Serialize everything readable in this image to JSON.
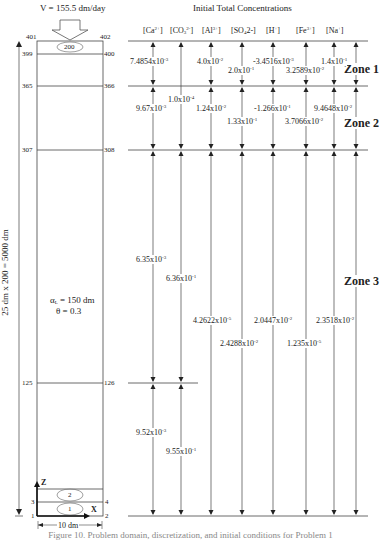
{
  "velocity_label": "V = 155.5 dm/day",
  "title": "Initial Total Concentrations",
  "species": [
    "[Ca2+]",
    "[CO32-]",
    "[Al3+]",
    "[SO42-]",
    "[H+]",
    "[Fe3+]",
    "[Na+]"
  ],
  "species_display": {
    "ca": {
      "base": "[Ca",
      "sup": "2+",
      "end": "]"
    },
    "co3": {
      "base": "[CO",
      "sub": "3",
      "sup": "2-",
      "end": "]"
    },
    "al": {
      "base": "[Al",
      "sup": "3+",
      "end": "]"
    },
    "so4": {
      "base": "[SO",
      "sub": "4",
      "after": "2-]"
    },
    "h": {
      "base": "[H",
      "sup": "+",
      "end": "]"
    },
    "fe": {
      "base": "[Fe",
      "sup": "3+",
      "end": "]"
    },
    "na": {
      "base": "[Na",
      "sup": "+",
      "end": "]"
    }
  },
  "zones": {
    "zone1": "Zone 1",
    "zone2": "Zone 2",
    "zone3": "Zone 3"
  },
  "nodes": {
    "n401": "401",
    "n402": "402",
    "n399": "399",
    "n400": "400",
    "n365": "365",
    "n366": "366",
    "n307": "307",
    "n308": "308",
    "n125": "125",
    "n126": "126",
    "n3": "3",
    "n4": "4",
    "n1": "1",
    "n2": "2"
  },
  "elements": {
    "top": "200",
    "e2": "2",
    "e1": "1"
  },
  "column_params": {
    "alpha": "α",
    "alpha_sub": "L",
    "alpha_rest": " = 150 dm",
    "theta": "θ = 0.3"
  },
  "height_label": "25 dm x 200 = 5000 dm",
  "width_label": "10 dm",
  "axes": {
    "z": "Z",
    "x": "X"
  },
  "values": {
    "zone1": {
      "ca": {
        "m": "7.4854x10",
        "e": "-3"
      },
      "al": {
        "m": "4.0x10",
        "e": "-2"
      },
      "so4": {
        "m": "2.0x10",
        "e": "-1"
      },
      "h": {
        "m": "-3.4516x10",
        "e": "-3"
      },
      "fe": {
        "m": "3.2589x10",
        "e": "-2"
      },
      "na": {
        "m": "1.4x10",
        "e": "-1"
      }
    },
    "co3_zone12": {
      "m": "1.0x10",
      "e": "-4"
    },
    "zone2": {
      "ca": {
        "m": "9.67x10",
        "e": "-3"
      },
      "al": {
        "m": "1.24x10",
        "e": "-2"
      },
      "so4": {
        "m": "1.33x10",
        "e": "-1"
      },
      "h": {
        "m": "-1.266x10",
        "e": "-1"
      },
      "fe": {
        "m": "3.7066x10",
        "e": "-2"
      },
      "na": {
        "m": "9.4648x10",
        "e": "-2"
      }
    },
    "zone3_upper": {
      "ca": {
        "m": "6.35x10",
        "e": "-3"
      },
      "co3": {
        "m": "6.36x10",
        "e": "-1"
      }
    },
    "zone3": {
      "al": {
        "m": "4.2622x10",
        "e": "-5"
      },
      "so4": {
        "m": "2.4288x10",
        "e": "-2"
      },
      "h": {
        "m": "2.0447x10",
        "e": "-2"
      },
      "fe": {
        "m": "1.235x10",
        "e": "-5"
      },
      "na": {
        "m": "2.3518x10",
        "e": "-2"
      }
    },
    "zone3_lower": {
      "ca": {
        "m": "9.52x10",
        "e": "-3"
      },
      "co3": {
        "m": "9.55x10",
        "e": "-1"
      }
    }
  },
  "caption": "Figure 10. Problem domain, discretization, and initial conditions for Problem 1"
}
